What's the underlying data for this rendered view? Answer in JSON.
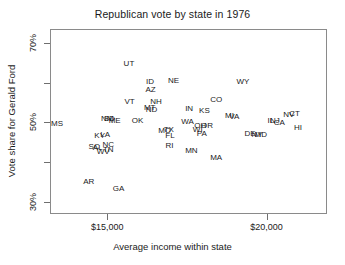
{
  "chart_data": {
    "type": "scatter",
    "title": "Republican vote by state in 1976",
    "xlabel": "Average income within state",
    "ylabel": "Vote share for Gerald Ford",
    "xlim": [
      13200,
      21900
    ],
    "ylim": [
      27.0,
      73.5
    ],
    "grid": false,
    "legend": null,
    "marker_style": "text-label-only",
    "xticks": [
      {
        "value": 15000,
        "label": "$15,000"
      },
      {
        "value": 20000,
        "label": "$20,000"
      }
    ],
    "xminorticks": [],
    "yticks": [
      {
        "value": 30,
        "label": "30%"
      },
      {
        "value": 40,
        "label": ""
      },
      {
        "value": 50,
        "label": "50%"
      },
      {
        "value": 60,
        "label": ""
      },
      {
        "value": 70,
        "label": "70%"
      }
    ],
    "point_label_field": "state",
    "points": [
      {
        "state": "MS",
        "x": 13420,
        "y": 49.6
      },
      {
        "state": "AR",
        "x": 14420,
        "y": 35.0
      },
      {
        "state": "SC",
        "x": 14580,
        "y": 43.9
      },
      {
        "state": "AL",
        "x": 14700,
        "y": 43.6
      },
      {
        "state": "KY",
        "x": 14760,
        "y": 46.6
      },
      {
        "state": "LA",
        "x": 14930,
        "y": 46.8
      },
      {
        "state": "WV",
        "x": 14870,
        "y": 42.5
      },
      {
        "state": "TN",
        "x": 15030,
        "y": 43.0
      },
      {
        "state": "NC",
        "x": 15030,
        "y": 44.4
      },
      {
        "state": "NM",
        "x": 15000,
        "y": 51.0
      },
      {
        "state": "SD",
        "x": 15060,
        "y": 51.0
      },
      {
        "state": "ME",
        "x": 15230,
        "y": 50.4
      },
      {
        "state": "GA",
        "x": 15350,
        "y": 33.4
      },
      {
        "state": "UT",
        "x": 15680,
        "y": 64.8
      },
      {
        "state": "VT",
        "x": 15700,
        "y": 55.1
      },
      {
        "state": "OK",
        "x": 15950,
        "y": 50.5
      },
      {
        "state": "ID",
        "x": 16340,
        "y": 60.3
      },
      {
        "state": "AZ",
        "x": 16360,
        "y": 58.1
      },
      {
        "state": "ND",
        "x": 16390,
        "y": 53.2
      },
      {
        "state": "MT",
        "x": 16330,
        "y": 53.6
      },
      {
        "state": "NH",
        "x": 16530,
        "y": 55.1
      },
      {
        "state": "MO",
        "x": 16800,
        "y": 47.9
      },
      {
        "state": "TX",
        "x": 16930,
        "y": 48.0
      },
      {
        "state": "FL",
        "x": 16970,
        "y": 46.7
      },
      {
        "state": "RI",
        "x": 16950,
        "y": 44.1
      },
      {
        "state": "NE",
        "x": 17080,
        "y": 60.5
      },
      {
        "state": "WA",
        "x": 17520,
        "y": 50.2
      },
      {
        "state": "IN",
        "x": 17570,
        "y": 53.4
      },
      {
        "state": "MN",
        "x": 17640,
        "y": 42.8
      },
      {
        "state": "WI",
        "x": 17840,
        "y": 48.0
      },
      {
        "state": "OH",
        "x": 17920,
        "y": 49.0
      },
      {
        "state": "PA",
        "x": 17970,
        "y": 47.2
      },
      {
        "state": "OR",
        "x": 18130,
        "y": 49.0
      },
      {
        "state": "KS",
        "x": 18050,
        "y": 53.0
      },
      {
        "state": "CO",
        "x": 18420,
        "y": 55.6
      },
      {
        "state": "MA",
        "x": 18420,
        "y": 41.0
      },
      {
        "state": "MI",
        "x": 18840,
        "y": 51.7
      },
      {
        "state": "VA",
        "x": 18990,
        "y": 51.4
      },
      {
        "state": "WY",
        "x": 19260,
        "y": 60.2
      },
      {
        "state": "DE",
        "x": 19480,
        "y": 47.0
      },
      {
        "state": "NY",
        "x": 19700,
        "y": 46.9
      },
      {
        "state": "MD",
        "x": 19820,
        "y": 46.8
      },
      {
        "state": "IL",
        "x": 20140,
        "y": 50.3
      },
      {
        "state": "NJ",
        "x": 20260,
        "y": 50.3
      },
      {
        "state": "CA",
        "x": 20400,
        "y": 49.9
      },
      {
        "state": "NV",
        "x": 20700,
        "y": 51.8
      },
      {
        "state": "CT",
        "x": 20880,
        "y": 52.1
      },
      {
        "state": "HI",
        "x": 20990,
        "y": 48.5
      }
    ]
  }
}
